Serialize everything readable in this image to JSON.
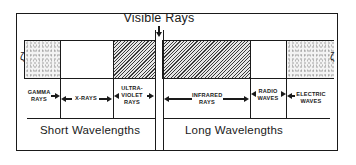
{
  "diagram": {
    "title": "Visible Rays",
    "bands": [
      {
        "id": "gamma",
        "label_lines": [
          "GAMMA",
          "RAYS"
        ],
        "fill": "stippled"
      },
      {
        "id": "xray",
        "label_lines": [
          "X-RAYS"
        ],
        "fill": "white"
      },
      {
        "id": "ultraviolet",
        "label_lines": [
          "ULTRA-",
          "VIOLET",
          "RAYS"
        ],
        "fill": "hatched"
      },
      {
        "id": "visible",
        "label_lines": [],
        "fill": "white-strip"
      },
      {
        "id": "infrared",
        "label_lines": [
          "INFRARED",
          "RAYS"
        ],
        "fill": "hatched"
      },
      {
        "id": "radio",
        "label_lines": [
          "RADIO",
          "WAVES"
        ],
        "fill": "white"
      },
      {
        "id": "electric",
        "label_lines": [
          "ELECTRIC",
          "WAVES"
        ],
        "fill": "stippled"
      }
    ],
    "ranges": {
      "short": "Short Wavelengths",
      "long": "Long Wavelengths"
    },
    "colors": {
      "ink": "#1a1a1a",
      "background": "#ffffff",
      "hatch": "#3a3a3a",
      "stipple": "#9a9a9a"
    }
  }
}
